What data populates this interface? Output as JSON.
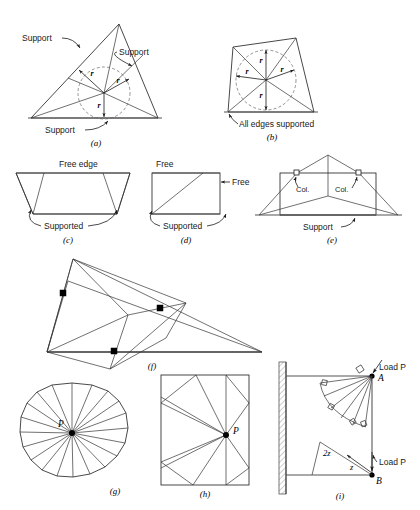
{
  "figure": {
    "panels": [
      {
        "id": "a",
        "caption": "(a)",
        "shape": "triangle",
        "description": "Triangular slab simply supported on all three edges with inscribed circle of radius r",
        "labels": [
          "Support",
          "Support",
          "Support"
        ],
        "radius_labels": [
          "r",
          "r",
          "r"
        ],
        "inscribed_circle": true
      },
      {
        "id": "b",
        "caption": "(b)",
        "shape": "quadrilateral",
        "description": "Quadrilateral slab with all edges supported and inscribed circle of radius r",
        "labels": [
          "All edges supported"
        ],
        "radius_labels": [
          "r",
          "r",
          "r",
          "r"
        ],
        "inscribed_circle": true
      },
      {
        "id": "c",
        "caption": "(c)",
        "shape": "trapezoid",
        "description": "Trapezoidal slab with one free edge and remaining edges supported",
        "labels": [
          "Free edge",
          "Supported"
        ]
      },
      {
        "id": "d",
        "caption": "(d)",
        "shape": "rectangle",
        "description": "Rectangular slab with two adjacent free edges and two supported edges",
        "labels": [
          "Free",
          "Free",
          "Supported"
        ]
      },
      {
        "id": "e",
        "caption": "(e)",
        "shape": "rectangle-with-columns",
        "description": "Rectangular slab supported on one edge and on two interior columns",
        "labels": [
          "Col.",
          "Col.",
          "Support"
        ]
      },
      {
        "id": "f",
        "caption": "(f)",
        "shape": "irregular-quadrilateral",
        "description": "Slab supported on columns at three points with intersecting yield lines",
        "labels": [],
        "column_markers": 3
      },
      {
        "id": "g",
        "caption": "(g)",
        "shape": "irregular-disc",
        "description": "Fan yield-line pattern radiating from concentrated load point P",
        "point_label": "P",
        "ray_count": 20
      },
      {
        "id": "h",
        "caption": "(h)",
        "shape": "rectangle-fan",
        "description": "Rectangular slab with fan pattern radiating from point P",
        "point_label": "P"
      },
      {
        "id": "i",
        "caption": "(i)",
        "shape": "cantilever-wall",
        "description": "Cantilever slab from a wall with loads P at corners A and B",
        "labels": [
          "Load P",
          "Load P"
        ],
        "point_labels": [
          "A",
          "B"
        ],
        "dimension_labels": [
          "2z",
          "z"
        ]
      }
    ],
    "text": {
      "support": "Support",
      "all_edges_supported": "All edges supported",
      "free_edge": "Free edge",
      "free": "Free",
      "supported": "Supported",
      "col": "Col.",
      "load_p": "Load P",
      "point_a": "A",
      "point_b": "B",
      "point_p": "P",
      "r": "r",
      "two_z": "2z",
      "z": "z"
    },
    "colors": {
      "line": "#1a1a1a",
      "dashed": "#666666",
      "baseline": "#555555",
      "marker_filled": "#000000",
      "background": "#ffffff"
    }
  }
}
